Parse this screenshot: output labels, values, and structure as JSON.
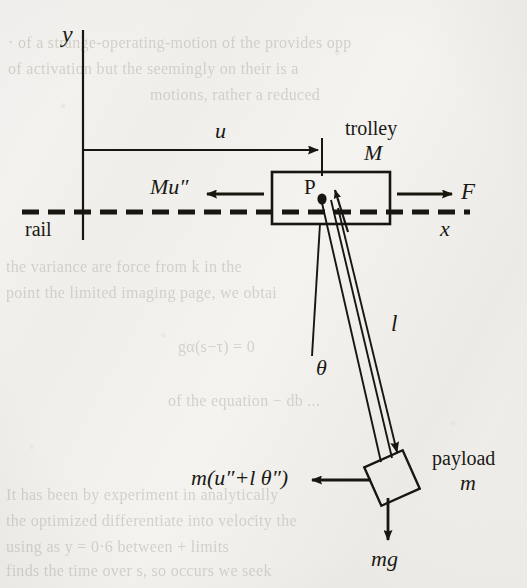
{
  "figure": {
    "kind": "free-body-diagram",
    "ink_color": "#17160f",
    "paper_color": "#f2f1ef"
  },
  "axes": {
    "y_label": "y",
    "x_label": "x"
  },
  "labels": {
    "displacement": "u",
    "trolley_name": "trolley",
    "trolley_mass": "M",
    "rail": "rail",
    "point_p": "P",
    "inertia_force_trolley": "Mu″",
    "drive_force": "F",
    "angle": "θ",
    "cable_length": "l",
    "payload_name": "payload",
    "payload_mass": "m",
    "inertia_force_payload": "m(u″+l θ″)",
    "weight": "mg"
  },
  "bleed_through_text": [
    "· of a strange-operating-motion of the provides opp",
    "of activation but the seemingly on their is a",
    "motions, rather a reduced",
    "the variance are force from k in the",
    "point the limited imaging  page, we obtai",
    "gα(s−τ) = 0",
    "of the equation  − db ...",
    "It has been by experiment in analytically",
    "the optimized  differentiate  into velocity the",
    "using as y = 0·6 between + limits",
    "finds the time  over s,  so occurs  we seek"
  ],
  "geometry": {
    "y_axis_x": 83,
    "y_axis_top": 30,
    "y_axis_bottom": 240,
    "u_arrow_y": 150,
    "u_arrow_x1": 83,
    "u_arrow_x2": 322,
    "rail_y": 212,
    "rail_x1": 22,
    "rail_x2": 470,
    "trolley_box": {
      "x": 272,
      "y": 172,
      "w": 118,
      "h": 52
    },
    "point_p": {
      "x": 322,
      "y": 200
    },
    "payload_center": {
      "x": 392,
      "y": 478
    },
    "cable_angle_deg": 14
  }
}
